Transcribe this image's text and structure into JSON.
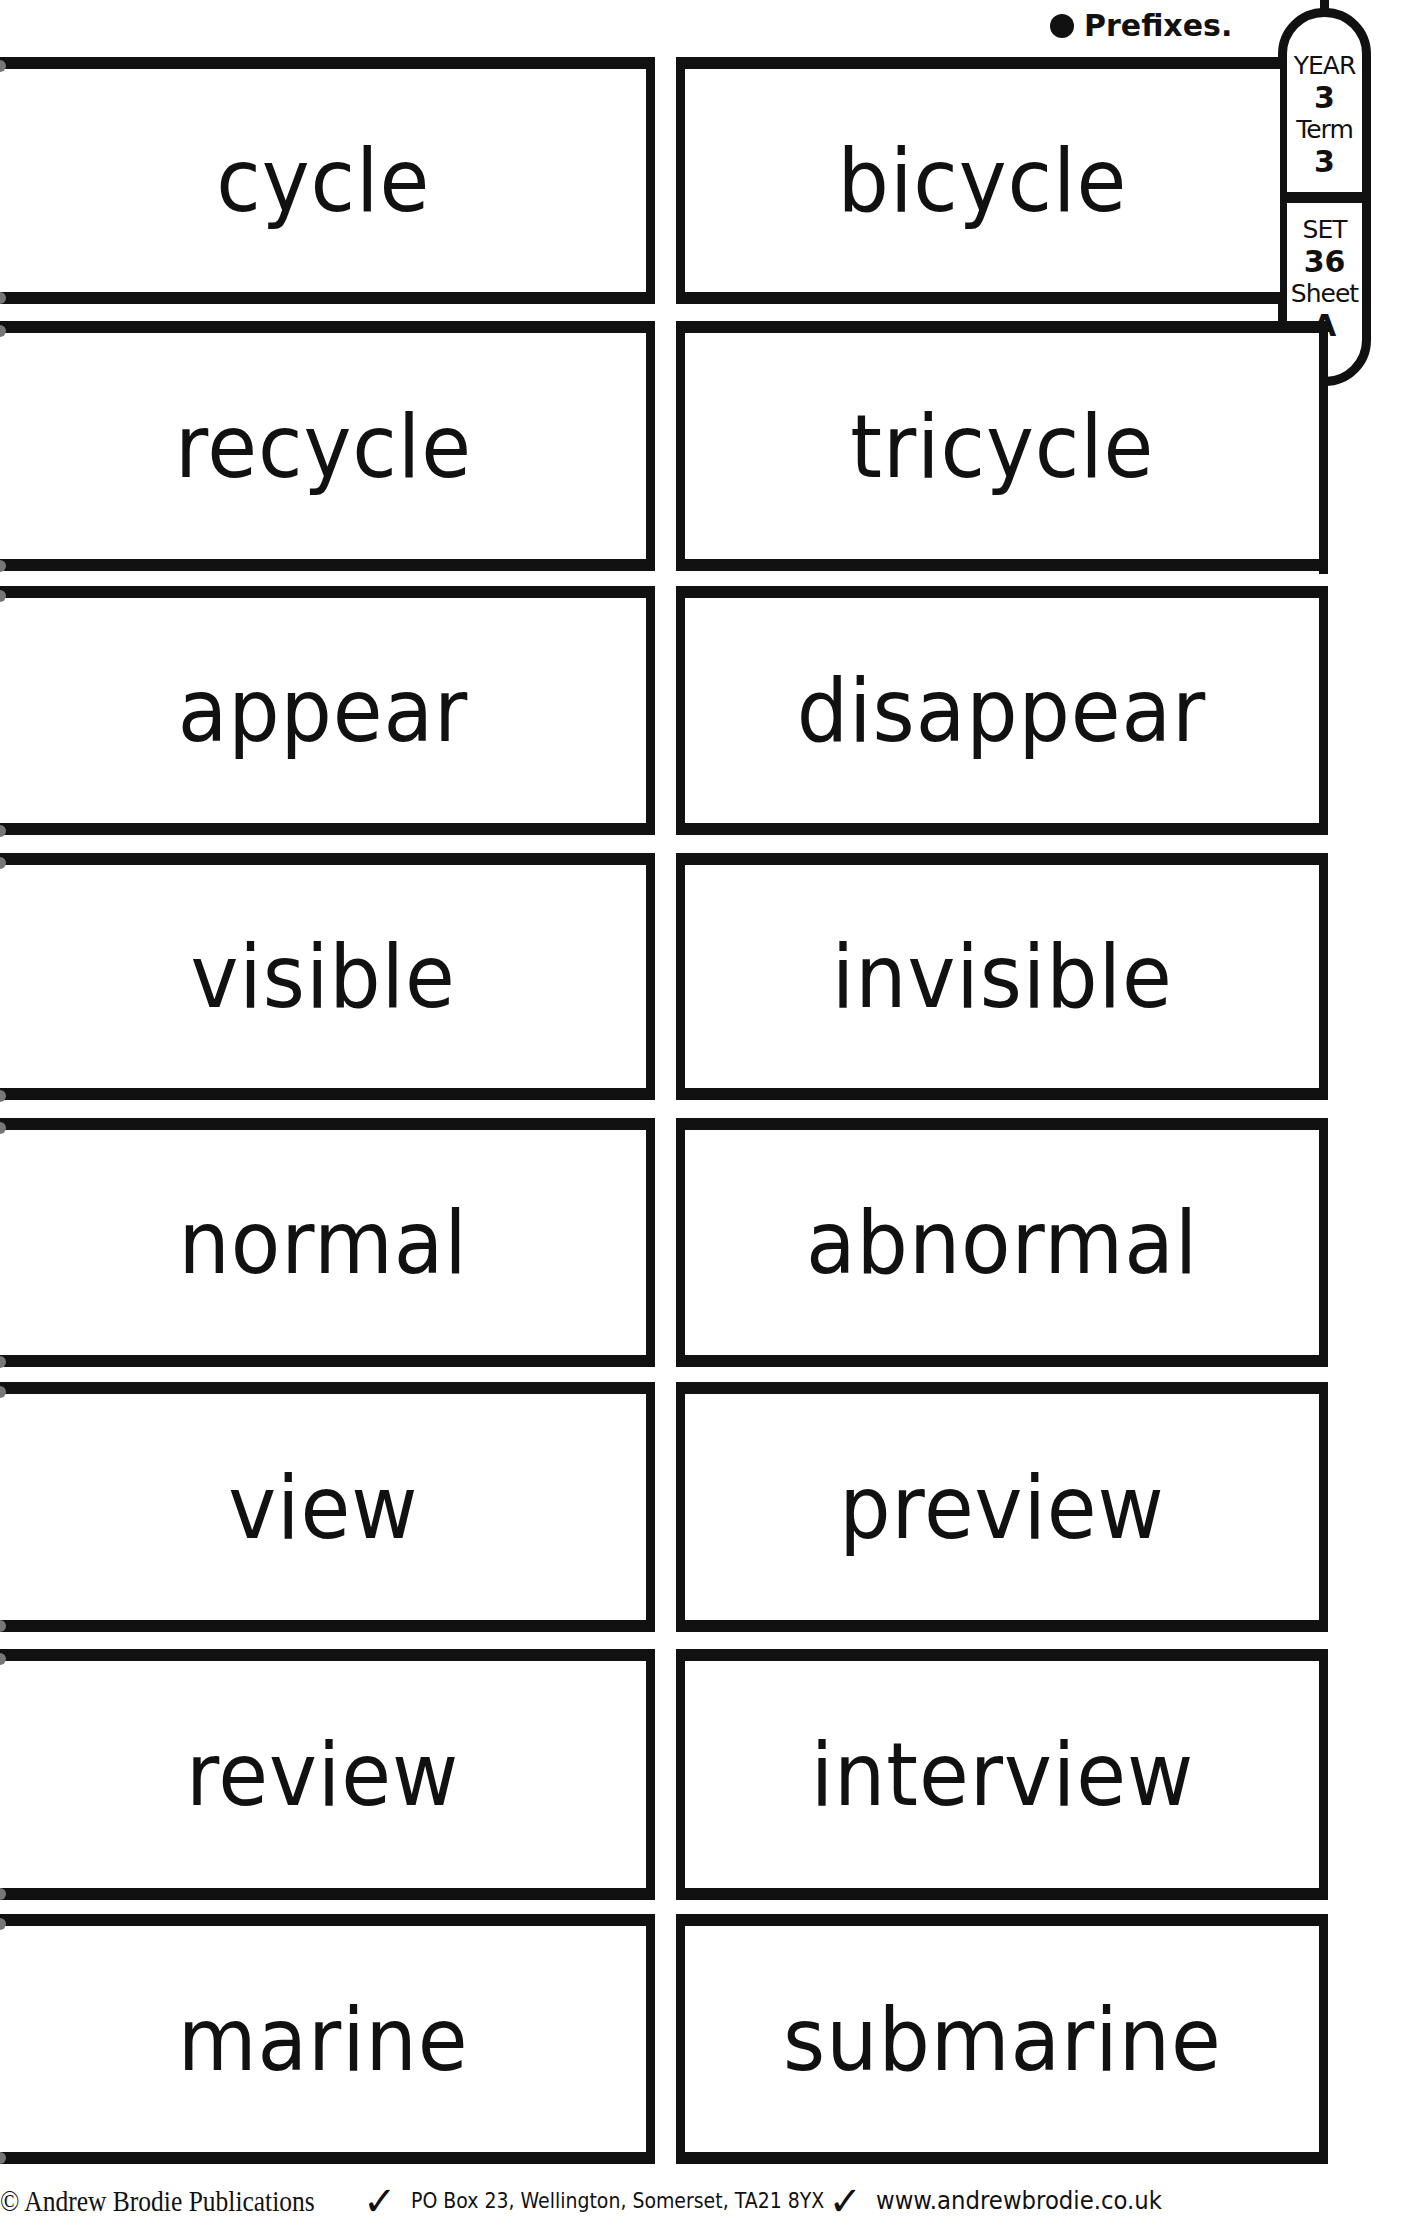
{
  "header": {
    "topic": "Prefixes.",
    "badge": {
      "year_label": "YEAR",
      "year_value": "3",
      "term_label": "Term",
      "term_value": "3",
      "set_label": "SET",
      "set_value": "36",
      "sheet_label": "Sheet",
      "sheet_value": "A"
    }
  },
  "cards": [
    {
      "root": "cycle",
      "prefixed": "bicycle"
    },
    {
      "root": "recycle",
      "prefixed": "tricycle"
    },
    {
      "root": "appear",
      "prefixed": "disappear"
    },
    {
      "root": "visible",
      "prefixed": "invisible"
    },
    {
      "root": "normal",
      "prefixed": "abnormal"
    },
    {
      "root": "view",
      "prefixed": "preview"
    },
    {
      "root": "review",
      "prefixed": "interview"
    },
    {
      "root": "marine",
      "prefixed": "submarine"
    }
  ],
  "footer": {
    "publisher": "© Andrew Brodie Publications",
    "separator": "✓",
    "address": "PO Box 23, Wellington, Somerset, TA21 8YX",
    "website": "www.andrewbrodie.co.uk"
  }
}
